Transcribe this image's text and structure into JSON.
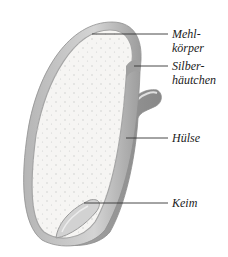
{
  "diagram": {
    "labels": [
      {
        "id": "mehlkoerper",
        "lines": [
          "Mehl-",
          "körper"
        ]
      },
      {
        "id": "silberhaeutchen",
        "lines": [
          "Silber-",
          "häutchen"
        ]
      },
      {
        "id": "huelse",
        "lines": [
          "Hülse"
        ]
      },
      {
        "id": "keim",
        "lines": [
          "Keim"
        ]
      }
    ]
  },
  "colors": {
    "background": "#ffffff",
    "endosperm": "#f6f5f3",
    "shell": "#c9c9c9",
    "shell_dark": "#9a9a9a",
    "leader_line": "#333333",
    "text": "#1a1a1a"
  }
}
